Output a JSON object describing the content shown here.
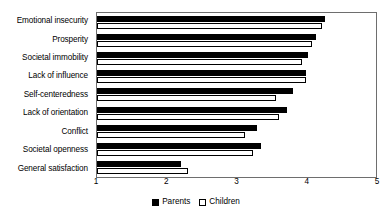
{
  "chart_data": {
    "type": "bar",
    "orientation": "horizontal",
    "title": "",
    "xlabel": "",
    "ylabel": "",
    "xlim": [
      1,
      5
    ],
    "xticks": [
      1,
      2,
      3,
      4,
      5
    ],
    "xtick_labels": [
      "1",
      "2",
      "3",
      "4",
      "5"
    ],
    "grid": false,
    "legend_position": "bottom-center",
    "categories": [
      "Emotional insecurity",
      "Prosperity",
      "Societal immobility",
      "Lack of influence",
      "Self-centeredness",
      "Lack of orientation",
      "Conflict",
      "Societal openness",
      "General satisfaction"
    ],
    "series": [
      {
        "name": "Parents",
        "color": "#000000",
        "values": [
          4.27,
          4.14,
          4.03,
          3.99,
          3.81,
          3.72,
          3.3,
          3.35,
          2.2
        ]
      },
      {
        "name": "Children",
        "color": "#ffffff",
        "values": [
          4.23,
          4.08,
          3.94,
          3.99,
          3.57,
          3.61,
          3.12,
          3.23,
          2.31
        ]
      }
    ]
  },
  "legend": {
    "entries": [
      {
        "label": "Parents",
        "swatch": "filled-square-icon"
      },
      {
        "label": "Children",
        "swatch": "outline-square-icon"
      }
    ]
  }
}
